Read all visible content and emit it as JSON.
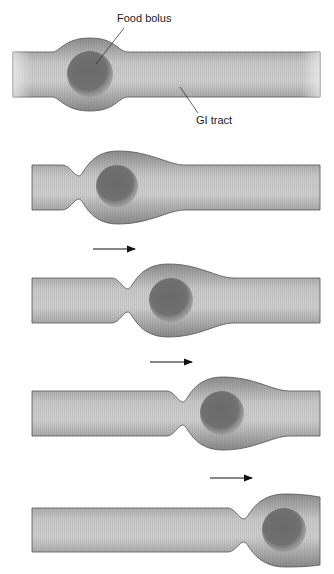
{
  "diagram": {
    "labels": {
      "bolus": "Food bolus",
      "tract": "GI tract"
    },
    "panels": [
      {
        "step": 1,
        "state": "bolus in tract, no contraction"
      },
      {
        "step": 2,
        "state": "contraction behind bolus"
      },
      {
        "step": 3,
        "state": "contraction moved right"
      },
      {
        "step": 4,
        "state": "contraction moved further right"
      },
      {
        "step": 5,
        "state": "bolus near right end"
      }
    ],
    "arrows": [
      {
        "direction": "right"
      },
      {
        "direction": "right"
      },
      {
        "direction": "right"
      }
    ],
    "colors": {
      "tube_light": "#cfcfcf",
      "tube_dark": "#8a8a8a",
      "outline": "#555555",
      "bolus": "#6e6e6e",
      "text": "#222222"
    }
  }
}
